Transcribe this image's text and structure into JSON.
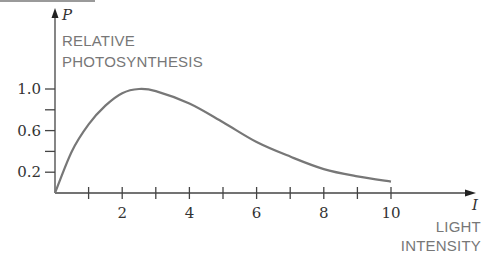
{
  "chart_data": {
    "type": "line",
    "title": "",
    "xlabel": "LIGHT INTENSITY",
    "xvar": "I",
    "ylabel": "RELATIVE PHOTOSYNTHESIS",
    "yvar": "P",
    "x_ticks": [
      1,
      2,
      3,
      4,
      5,
      6,
      7,
      8,
      9,
      10
    ],
    "x_tick_labels": [
      "2",
      "4",
      "6",
      "8",
      "10"
    ],
    "x_tick_label_values": [
      2,
      4,
      6,
      8,
      10
    ],
    "y_ticks": [
      0.2,
      0.4,
      0.6,
      0.8,
      1.0
    ],
    "y_tick_labels": [
      "0.2",
      "0.6",
      "1.0"
    ],
    "y_tick_label_values": [
      0.2,
      0.6,
      1.0
    ],
    "xlim": [
      0,
      10
    ],
    "ylim": [
      0,
      1.0
    ],
    "grid": false,
    "series": [
      {
        "name": "P(I)",
        "x": [
          0,
          0.5,
          1,
          1.5,
          2,
          2.5,
          3,
          4,
          5,
          6,
          7,
          8,
          9,
          10
        ],
        "values": [
          0,
          0.4,
          0.66,
          0.84,
          0.96,
          1.0,
          0.98,
          0.86,
          0.68,
          0.49,
          0.35,
          0.23,
          0.16,
          0.11
        ]
      }
    ]
  },
  "labels": {
    "y_var": "P",
    "y_line1": "RELATIVE",
    "y_line2": "PHOTOSYNTHESIS",
    "x_var": "I",
    "x_line1": "LIGHT",
    "x_line2": "INTENSITY"
  }
}
